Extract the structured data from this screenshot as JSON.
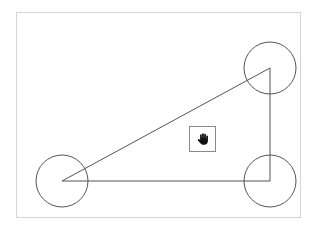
{
  "canvas": {
    "width": 317,
    "height": 232
  },
  "frame": {
    "x": 16,
    "y": 12,
    "width": 285,
    "height": 206,
    "border_color": "#d4d4d4"
  },
  "triangle": {
    "stroke": "#555555",
    "points": [
      {
        "name": "vertex-bottom-left",
        "x": 62,
        "y": 181
      },
      {
        "name": "vertex-top-right",
        "x": 270,
        "y": 68
      },
      {
        "name": "vertex-bottom-right",
        "x": 270,
        "y": 181
      }
    ]
  },
  "handles": [
    {
      "name": "handle-bottom-left",
      "cx": 62,
      "cy": 181,
      "r": 26
    },
    {
      "name": "handle-top-right",
      "cx": 270,
      "cy": 68,
      "r": 26
    },
    {
      "name": "handle-bottom-right",
      "cx": 270,
      "cy": 181,
      "r": 26
    }
  ],
  "handle_stroke": "#555555",
  "pan_tool": {
    "icon": "hand-icon",
    "x": 189,
    "y": 126,
    "width": 27,
    "height": 26,
    "border_color": "#8a8a8a"
  }
}
